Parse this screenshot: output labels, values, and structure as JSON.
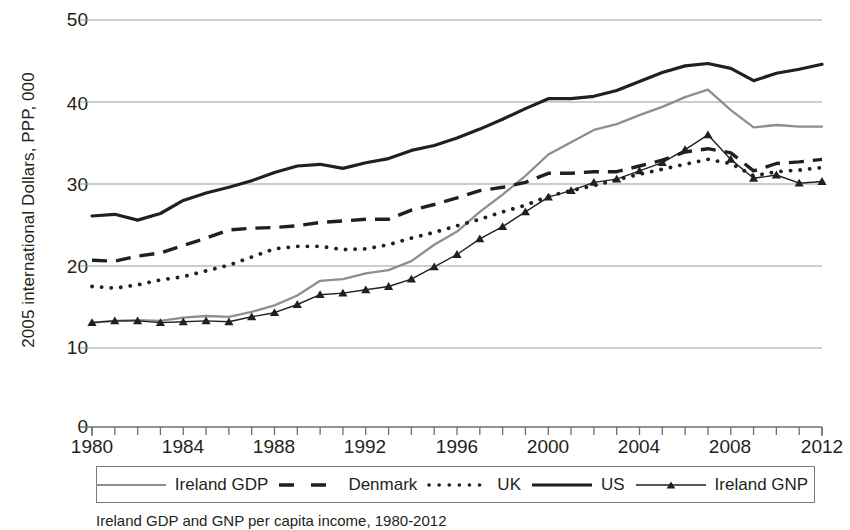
{
  "axes": {
    "ylabel": "2005 international Dollars, PPP, 000",
    "yticks": [
      "0",
      "10",
      "20",
      "30",
      "40",
      "50"
    ],
    "xticks": [
      "1980",
      "1984",
      "1988",
      "1992",
      "1996",
      "2000",
      "2004",
      "2008",
      "2012"
    ]
  },
  "legend": {
    "items": [
      {
        "label": "Ireland GDP",
        "style": "solid-gray"
      },
      {
        "label": "Denmark",
        "style": "dashed-black"
      },
      {
        "label": "UK",
        "style": "dotted-black"
      },
      {
        "label": "US",
        "style": "thick-solid-black"
      },
      {
        "label": "Ireland GNP",
        "style": "solid-black-triangle"
      }
    ]
  },
  "caption": "Ireland GDP and GNP per capita income, 1980-2012",
  "colors": {
    "ireland_gdp": "#8e8e8e",
    "black": "#231f20",
    "gridline": "#9b9b9b",
    "axis": "#6f6f6f"
  },
  "chart_data": {
    "type": "line",
    "title": "",
    "xlabel": "",
    "ylabel": "2005 international Dollars, PPP, 000",
    "xlim": [
      1980,
      2012
    ],
    "ylim": [
      10,
      50
    ],
    "y_axis_break_below": 10,
    "y_zero_shown": true,
    "grid": "horizontal",
    "legend_position": "bottom",
    "x": [
      1980,
      1981,
      1982,
      1983,
      1984,
      1985,
      1986,
      1987,
      1988,
      1989,
      1990,
      1991,
      1992,
      1993,
      1994,
      1995,
      1996,
      1997,
      1998,
      1999,
      2000,
      2001,
      2002,
      2003,
      2004,
      2005,
      2006,
      2007,
      2008,
      2009,
      2010,
      2011,
      2012
    ],
    "series": [
      {
        "name": "Ireland GDP",
        "values": [
          13.1,
          13.3,
          13.4,
          13.3,
          13.7,
          13.9,
          13.8,
          14.4,
          15.2,
          16.4,
          18.2,
          18.4,
          19.1,
          19.5,
          20.6,
          22.6,
          24.2,
          26.6,
          28.7,
          31.0,
          33.6,
          35.1,
          36.6,
          37.3,
          38.4,
          39.4,
          40.6,
          41.5,
          39.0,
          36.9,
          37.2,
          37.0,
          37.0
        ]
      },
      {
        "name": "Denmark",
        "values": [
          20.7,
          20.6,
          21.2,
          21.6,
          22.5,
          23.4,
          24.4,
          24.6,
          24.7,
          24.9,
          25.3,
          25.5,
          25.7,
          25.7,
          26.8,
          27.5,
          28.3,
          29.2,
          29.6,
          30.2,
          31.3,
          31.3,
          31.5,
          31.5,
          32.2,
          32.9,
          33.9,
          34.3,
          33.8,
          31.6,
          32.5,
          32.7,
          33.0
        ]
      },
      {
        "name": "UK",
        "values": [
          17.5,
          17.3,
          17.7,
          18.3,
          18.7,
          19.4,
          20.1,
          21.1,
          22.1,
          22.4,
          22.4,
          22.0,
          22.1,
          22.6,
          23.4,
          24.1,
          24.9,
          25.7,
          26.6,
          27.4,
          28.5,
          29.2,
          29.8,
          30.5,
          31.2,
          31.8,
          32.4,
          33.0,
          32.5,
          31.0,
          31.5,
          31.7,
          32.0
        ]
      },
      {
        "name": "US",
        "values": [
          26.1,
          26.3,
          25.6,
          26.4,
          28.0,
          28.9,
          29.6,
          30.4,
          31.4,
          32.2,
          32.4,
          31.9,
          32.6,
          33.1,
          34.1,
          34.7,
          35.6,
          36.7,
          37.9,
          39.2,
          40.4,
          40.4,
          40.7,
          41.4,
          42.5,
          43.6,
          44.4,
          44.7,
          44.1,
          42.6,
          43.5,
          44.0,
          44.6
        ]
      },
      {
        "name": "Ireland GNP",
        "values": [
          13.1,
          13.3,
          13.3,
          13.1,
          13.2,
          13.3,
          13.2,
          13.8,
          14.3,
          15.3,
          16.5,
          16.7,
          17.1,
          17.5,
          18.4,
          19.9,
          21.4,
          23.3,
          24.8,
          26.6,
          28.4,
          29.2,
          30.2,
          30.6,
          31.6,
          32.6,
          34.2,
          36.0,
          33.0,
          30.7,
          31.1,
          30.1,
          30.3
        ]
      }
    ]
  }
}
